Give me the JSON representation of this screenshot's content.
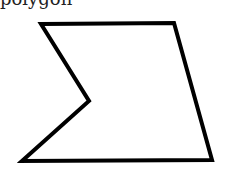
{
  "figure": {
    "clipped_text": "polygon",
    "shape": {
      "name": "concave-pentagon",
      "stroke": "#000000",
      "fill": "#ffffff",
      "stroke_width": 4,
      "points": "41,24 174,23 212,160 22,161 89,101"
    }
  }
}
